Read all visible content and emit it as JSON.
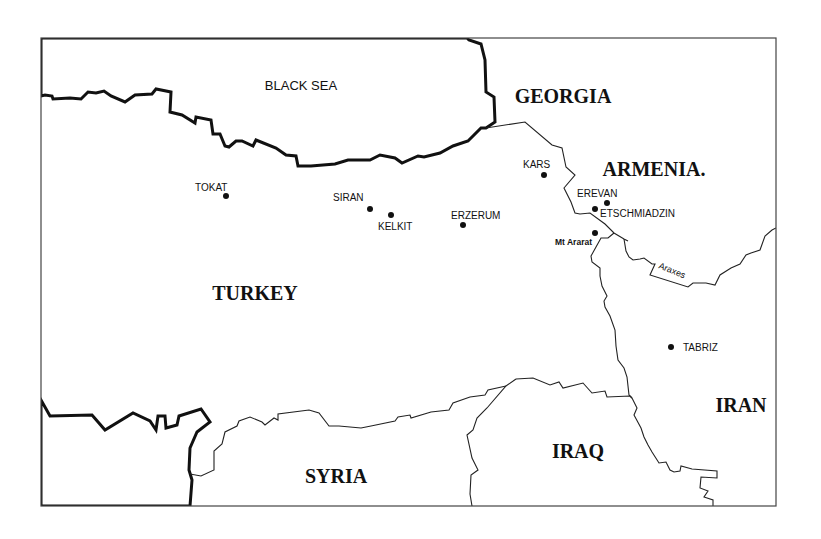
{
  "map": {
    "colors": {
      "land": "#ffffff",
      "sea_pattern": "#222222",
      "borders": "#222222",
      "text": "#111111"
    },
    "seas": [
      {
        "name": "BLACK SEA",
        "x": 300,
        "y": 88
      }
    ],
    "countries": [
      {
        "name": "GEORGIA",
        "x": 563,
        "y": 103,
        "size": 20
      },
      {
        "name": "ARMENIA.",
        "x": 597,
        "y": 175,
        "size": 20
      },
      {
        "name": "TURKEY",
        "x": 255,
        "y": 300,
        "size": 20
      },
      {
        "name": "SYRIA",
        "x": 336,
        "y": 483,
        "size": 20
      },
      {
        "name": "IRAQ",
        "x": 578,
        "y": 458,
        "size": 20
      },
      {
        "name": "IRAN",
        "x": 741,
        "y": 412,
        "size": 20
      }
    ],
    "cities": [
      {
        "name": "TOKAT",
        "dot_x": 226,
        "dot_y": 196,
        "label_x": 195,
        "label_y": 191,
        "anchor": "start"
      },
      {
        "name": "SIRAN",
        "dot_x": 370,
        "dot_y": 209,
        "label_x": 333,
        "label_y": 201,
        "anchor": "start"
      },
      {
        "name": "KELKIT",
        "dot_x": 391,
        "dot_y": 215,
        "label_x": 378,
        "label_y": 230,
        "anchor": "start"
      },
      {
        "name": "ERZERUM",
        "dot_x": 463,
        "dot_y": 225,
        "label_x": 451,
        "label_y": 220,
        "anchor": "start"
      },
      {
        "name": "KARS",
        "dot_x": 544,
        "dot_y": 175,
        "label_x": 523,
        "label_y": 168,
        "anchor": "start"
      },
      {
        "name": "EREVAN",
        "dot_x": 607,
        "dot_y": 203,
        "label_x": 577,
        "label_y": 197,
        "anchor": "start"
      },
      {
        "name": "ETSCHMIADZIN",
        "dot_x": 595,
        "dot_y": 209,
        "label_x": 600,
        "label_y": 217,
        "anchor": "start"
      },
      {
        "name": "Mt Ararat",
        "dot_x": 595,
        "dot_y": 233,
        "label_x": 555,
        "label_y": 245,
        "anchor": "start"
      },
      {
        "name": "TABRIZ",
        "dot_x": 671,
        "dot_y": 347,
        "label_x": 683,
        "label_y": 351,
        "anchor": "start"
      }
    ],
    "rivers": [
      {
        "name": "Araxes",
        "label_x": 658,
        "label_y": 268,
        "rotate": 22
      }
    ]
  }
}
